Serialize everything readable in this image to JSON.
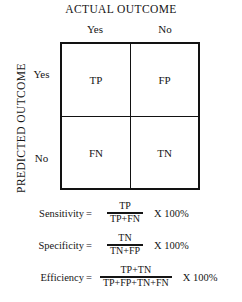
{
  "figure": {
    "title": "ACTUAL OUTCOME",
    "vertical_axis_label": "PREDICTED OUTCOME"
  },
  "matrix": {
    "column_headers": [
      "Yes",
      "No"
    ],
    "row_headers": [
      "Yes",
      "No"
    ],
    "cells": [
      [
        "TP",
        "FP"
      ],
      [
        "FN",
        "TN"
      ]
    ]
  },
  "formulas": [
    {
      "name": "Sensitivity",
      "equals": "=",
      "numerator": "TP",
      "denominator": "TP+FN",
      "multiplier": "X 100%"
    },
    {
      "name": "Specificity",
      "equals": "=",
      "numerator": "TN",
      "denominator": "TN+FP",
      "multiplier": "X 100%"
    },
    {
      "name": "Efficiency",
      "equals": "=",
      "numerator": "TP+TN",
      "denominator": "TP+FP+TN+FN",
      "multiplier": "X 100%"
    }
  ],
  "colors": {
    "border": "#121212",
    "text": "#151515",
    "background": "#ffffff"
  }
}
